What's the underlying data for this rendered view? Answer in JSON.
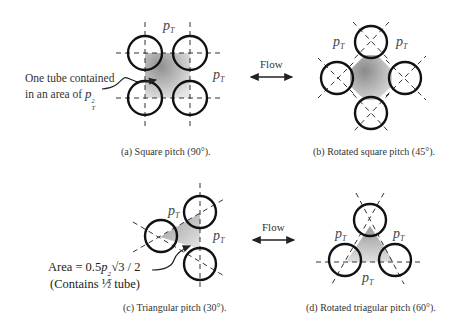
{
  "panels": {
    "a": {
      "caption": "(a) Square pitch (90°).",
      "annotation_line1": "One tube contained",
      "annotation_line2": "in an area of",
      "annotation_symbol": "p",
      "annotation_sub": "T",
      "annotation_sup": "2",
      "pitch_label": "p",
      "pitch_sub": "T"
    },
    "b": {
      "caption": "(b) Rotated square pitch (45°).",
      "pitch_label": "p",
      "pitch_sub": "T"
    },
    "c": {
      "caption": "(c) Triangular pitch (30°).",
      "formula_prefix": "Area = 0.5",
      "formula_symbol": "p",
      "formula_sup": "2",
      "formula_sub": "T",
      "formula_suffix": "√3 / 2",
      "formula_note": "(Contains ½ tube)",
      "pitch_label": "p",
      "pitch_sub": "T"
    },
    "d": {
      "caption": "(d) Rotated triagular pitch (60°).",
      "pitch_label": "p",
      "pitch_sub": "T"
    }
  },
  "flow": {
    "label": "Flow"
  }
}
